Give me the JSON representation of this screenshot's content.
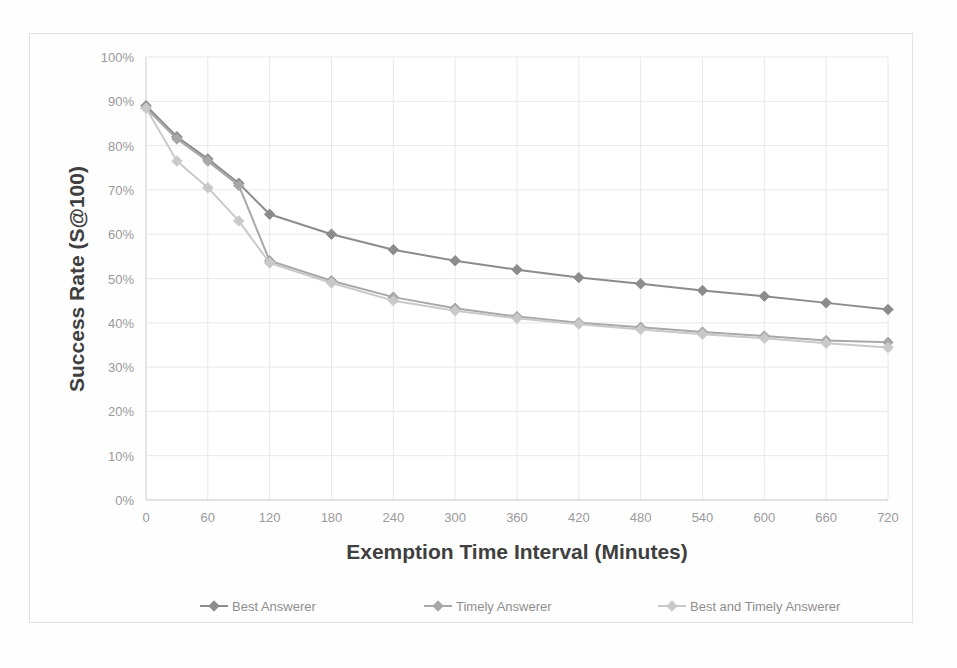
{
  "chart_data": {
    "type": "line",
    "title": "",
    "xlabel": "Exemption Time Interval (Minutes)",
    "ylabel": "Success Rate (S@100)",
    "xlim": [
      0,
      720
    ],
    "ylim": [
      0,
      1.0
    ],
    "grid": true,
    "legend_position": "bottom",
    "x_tick_labels": [
      "0",
      "60",
      "120",
      "180",
      "240",
      "300",
      "360",
      "420",
      "480",
      "540",
      "600",
      "660",
      "720"
    ],
    "x_ticks": [
      0,
      60,
      120,
      180,
      240,
      300,
      360,
      420,
      480,
      540,
      600,
      660,
      720
    ],
    "y_tick_labels": [
      "0%",
      "10%",
      "20%",
      "30%",
      "40%",
      "50%",
      "60%",
      "70%",
      "80%",
      "90%",
      "100%"
    ],
    "y_ticks": [
      0,
      10,
      20,
      30,
      40,
      50,
      60,
      70,
      80,
      90,
      100
    ],
    "x": [
      0,
      30,
      60,
      90,
      120,
      180,
      240,
      300,
      360,
      420,
      480,
      540,
      600,
      660,
      720
    ],
    "series": [
      {
        "name": "Best Answerer",
        "color": "#8c8c8c",
        "marker": "diamond",
        "values": [
          89.0,
          82.0,
          77.0,
          71.5,
          64.5,
          60.0,
          56.5,
          54.0,
          52.0,
          50.2,
          48.8,
          47.3,
          46.0,
          44.5,
          43.0
        ]
      },
      {
        "name": "Timely Answerer",
        "color": "#a8a8a8",
        "marker": "diamond",
        "values": [
          88.5,
          81.5,
          76.5,
          71.0,
          54.0,
          49.5,
          45.8,
          43.3,
          41.4,
          40.0,
          39.0,
          37.9,
          37.0,
          36.0,
          35.6
        ]
      },
      {
        "name": "Best and Timely Answerer",
        "color": "#c9c9c9",
        "marker": "diamond",
        "values": [
          88.5,
          76.5,
          70.5,
          63.0,
          53.5,
          49.0,
          45.0,
          42.7,
          41.0,
          39.7,
          38.5,
          37.4,
          36.5,
          35.4,
          34.4
        ]
      }
    ]
  },
  "axes": {
    "y_title": "Success Rate (S@100)",
    "x_title": "Exemption Time Interval (Minutes)"
  },
  "legend": {
    "items": [
      {
        "label": "Best Answerer"
      },
      {
        "label": "Timely Answerer"
      },
      {
        "label": "Best and Timely Answerer"
      }
    ]
  },
  "colors": {
    "series1": "#8c8c8c",
    "series2": "#a8a8a8",
    "series3": "#c9c9c9",
    "grid": "#e8e8e8",
    "axis_text": "#9a9a9a",
    "title_text": "#3f3f3f",
    "frame": "#e3e3e3"
  }
}
